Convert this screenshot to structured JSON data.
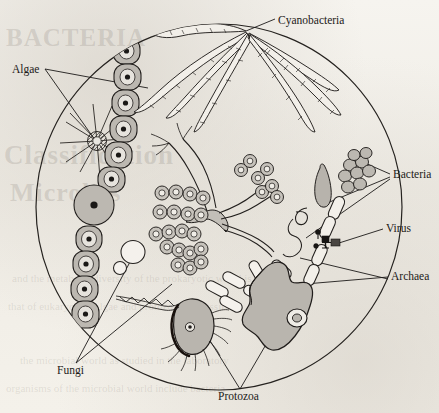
{
  "figure": {
    "kind": "microbiology-diagram",
    "frame_shape": "circle",
    "palette": {
      "ink": "#1c1a18",
      "cell_fill": "#b9b5ae",
      "cell_fill_light": "#cfcbc4",
      "paper": "#f3f1ec",
      "showthrough": "#78706840"
    }
  },
  "labels": [
    {
      "id": "cyanobacteria",
      "text": "Cyanobacteria",
      "x": 278,
      "y": 14,
      "leaders": 1
    },
    {
      "id": "algae",
      "text": "Algae",
      "x": 12,
      "y": 65,
      "leaders": 2
    },
    {
      "id": "bacteria",
      "text": "Bacteria",
      "x": 393,
      "y": 170,
      "leaders": 3
    },
    {
      "id": "virus",
      "text": "Virus",
      "x": 386,
      "y": 224,
      "leaders": 1
    },
    {
      "id": "archaea",
      "text": "Archaea",
      "x": 391,
      "y": 272,
      "leaders": 2
    },
    {
      "id": "fungi",
      "text": "Fungi",
      "x": 57,
      "y": 366,
      "leaders": 2
    },
    {
      "id": "protozoa",
      "text": "Protozoa",
      "x": 218,
      "y": 392,
      "leaders": 2
    }
  ],
  "organisms": [
    {
      "id": "algae-filament",
      "label": "Algae",
      "kind": "chain-of-cells",
      "cell_count": 11,
      "note": "vertical chain of gray oval cells each with nucleus dot"
    },
    {
      "id": "algae-diatom-star",
      "label": "Algae",
      "kind": "star-diatom",
      "spine_count": 12,
      "note": "radiating spines from hatched center disc"
    },
    {
      "id": "cyanobacteria-filaments",
      "label": "Cyanobacteria",
      "kind": "filaments",
      "filament_count": 7,
      "note": "tapering segmented trichomes radiating from one point"
    },
    {
      "id": "fungal-hypha",
      "label": "Fungi",
      "kind": "branching-hypha",
      "note": "branched tube with gray body"
    },
    {
      "id": "fungal-spores",
      "label": "Fungi",
      "kind": "spore-chains",
      "spore_count": 26,
      "note": "chains of ring-shaped conidia"
    },
    {
      "id": "yeast-budding",
      "label": "Fungi",
      "kind": "budding-yeast",
      "note": "large circle with small bud"
    },
    {
      "id": "bacteria-cocci",
      "label": "Bacteria",
      "kind": "coccus-cluster",
      "cell_count": 9
    },
    {
      "id": "bacteria-rod",
      "label": "Bacteria",
      "kind": "curved-rod",
      "cell_count": 1
    },
    {
      "id": "bacteria-spirillum",
      "label": "Bacteria",
      "kind": "spirillum",
      "cell_count": 1
    },
    {
      "id": "bacteria-rod-chain",
      "label": "Bacteria",
      "kind": "rod-chain",
      "cell_count": 5
    },
    {
      "id": "virus-phages",
      "label": "Virus",
      "kind": "bacteriophage",
      "count": 3,
      "note": "dark head-and-tail particles on rod chain"
    },
    {
      "id": "archaea-rods",
      "label": "Archaea",
      "kind": "outlined-rods",
      "cell_count": 6
    },
    {
      "id": "protozoa-amoeba",
      "label": "Protozoa",
      "kind": "amoeba",
      "note": "gray lobed body with ring nucleus"
    },
    {
      "id": "protozoa-flagellate",
      "label": "Protozoa",
      "kind": "ciliate-flagellate",
      "note": "teardrop body with cilia and braided flagellum"
    }
  ],
  "showthrough_text": {
    "big": [
      "BACTERIA",
      "Classification",
      "Microbes"
    ],
    "lines": [
      "and the metabolic diversity of the prokaryotic world is",
      "that of eukaryotes. Algae and protozoa are classified",
      "the microbial world as studied in the laboratory",
      "organisms of the microbial world include bacteria"
    ]
  }
}
